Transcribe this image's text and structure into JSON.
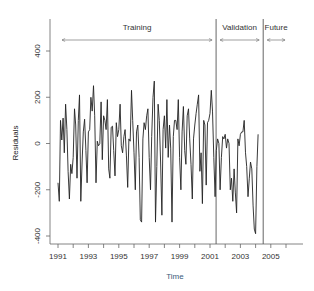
{
  "chart_data": {
    "type": "line",
    "title": "",
    "xlabel": "Time",
    "ylabel": "Residuals",
    "xlim": [
      1990.6,
      2007.0
    ],
    "ylim": [
      -430,
      550
    ],
    "grid": false,
    "legend": null,
    "x_ticks": [
      1991,
      1992,
      1993,
      1994,
      1995,
      1996,
      1997,
      1998,
      1999,
      2000,
      2001,
      2002,
      2003,
      2004,
      2005,
      2006
    ],
    "x_tick_labels": [
      "1991",
      "1993",
      "1995",
      "1997",
      "1999",
      "2001",
      "2003",
      "2005"
    ],
    "y_ticks": [
      -400,
      -200,
      0,
      200,
      400
    ],
    "y_tick_labels": [
      "-400",
      "-200",
      "0",
      "200",
      "400"
    ],
    "x_start": 1991.0,
    "x_step": 0.0833333,
    "series": [
      {
        "name": "Residuals",
        "color": "#222222",
        "values": [
          -170,
          -250,
          100,
          15,
          110,
          -40,
          170,
          60,
          -120,
          -240,
          -90,
          -130,
          -60,
          150,
          80,
          -150,
          100,
          210,
          -250,
          -80,
          50,
          105,
          -30,
          -170,
          50,
          60,
          200,
          140,
          250,
          120,
          -170,
          10,
          -10,
          0,
          180,
          -70,
          120,
          100,
          60,
          190,
          -110,
          -150,
          70,
          75,
          -30,
          -140,
          90,
          30,
          60,
          170,
          -10,
          -40,
          30,
          60,
          -50,
          -190,
          20,
          10,
          230,
          100,
          -40,
          -200,
          50,
          80,
          -60,
          -330,
          -340,
          20,
          90,
          60,
          120,
          150,
          -60,
          -200,
          30,
          200,
          270,
          -340,
          -100,
          170,
          100,
          -80,
          -310,
          60,
          120,
          -20,
          190,
          -60,
          80,
          -20,
          -340,
          30,
          100,
          100,
          60,
          190,
          -60,
          -200,
          50,
          160,
          -30,
          -90,
          120,
          150,
          20,
          -90,
          -240,
          20,
          80,
          130,
          170,
          210,
          -120,
          -40,
          -260,
          100,
          80,
          -180,
          90,
          100,
          130,
          230
        ]
      },
      {
        "name": "Validation",
        "color": "#222222",
        "values": [
          140,
          -60,
          -230,
          -30,
          20,
          0,
          -200,
          -60,
          30,
          20,
          40,
          -20,
          20,
          0,
          -200,
          -150,
          -250,
          -110,
          -210,
          -300,
          20,
          -10,
          40,
          50,
          50,
          100,
          -40,
          -100,
          -230,
          -150,
          -80,
          -110,
          -270,
          -370,
          -390,
          -100,
          40
        ]
      }
    ],
    "annotations": [
      {
        "label": "Training",
        "x_from": 1991.0,
        "x_to": 2001.4
      },
      {
        "label": "Validation",
        "x_from": 2001.4,
        "x_to": 2004.5
      },
      {
        "label": "Future",
        "x_from": 2004.5,
        "x_to": 2006.2
      }
    ],
    "vertical_lines": [
      2001.4,
      2004.5
    ]
  }
}
